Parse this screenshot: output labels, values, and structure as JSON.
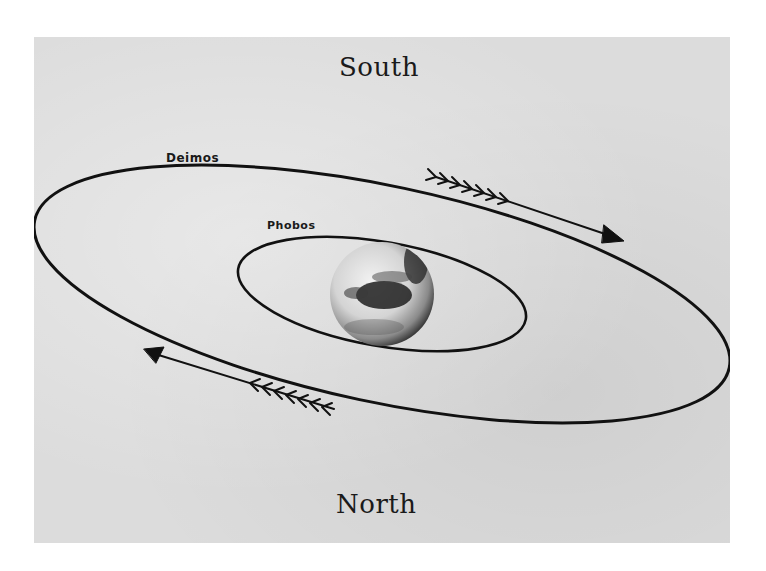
{
  "diagram": {
    "labels": {
      "top": "South",
      "bottom": "North",
      "outer_orbit": "Deimos",
      "inner_orbit": "Phobos"
    },
    "central_body": {
      "name": "Mars",
      "icon": "planet-sphere-icon"
    },
    "orbits": [
      {
        "name": "Deimos",
        "type": "outer-ellipse"
      },
      {
        "name": "Phobos",
        "type": "inner-ellipse"
      }
    ],
    "motion_arrows": [
      {
        "position": "upper-right",
        "direction": "toward lower-right",
        "icon": "feathered-arrow-icon"
      },
      {
        "position": "lower-left",
        "direction": "toward upper-left",
        "icon": "feathered-arrow-icon"
      }
    ],
    "colors": {
      "background": "#dcdcdc",
      "ink": "#111111",
      "page": "#ffffff"
    }
  }
}
